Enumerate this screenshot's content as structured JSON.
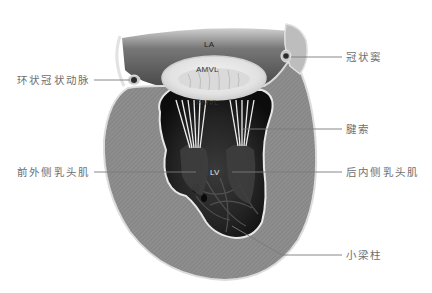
{
  "diagram": {
    "colors": {
      "background": "#ffffff",
      "myocardium": "#8d8d8d",
      "atrium": "#5e5e5e",
      "cavity": "#141414",
      "valve_ring": "#e6e6e6",
      "outline": "#d8d8d8",
      "leader_line": "#7a7a7a",
      "label_text": "#6e6e6e"
    },
    "inner_labels": {
      "la": "LA",
      "amvl": "AMVL",
      "pmvl": "PMVL",
      "lv": "LV"
    },
    "callouts": {
      "circumflex_artery": "环状冠状动脉",
      "coronary_sinus": "冠状窦",
      "chordae": "腱索",
      "anterolateral_papillary": "前外侧乳头肌",
      "posteromedial_papillary": "后内侧乳头肌",
      "trabeculae": "小梁柱"
    }
  }
}
